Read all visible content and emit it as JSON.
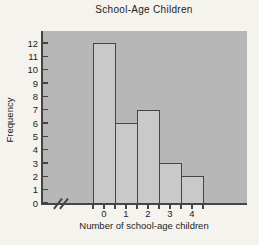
{
  "chart_data": {
    "type": "bar",
    "title": "School-Age Children",
    "xlabel": "Number of school-age children",
    "ylabel": "Frequency",
    "categories": [
      "0",
      "1",
      "2",
      "3",
      "4"
    ],
    "values": [
      12,
      6,
      7,
      3,
      2
    ],
    "ylim": [
      0,
      12
    ],
    "yticks": [
      0,
      1,
      2,
      3,
      4,
      5,
      6,
      7,
      8,
      9,
      10,
      11,
      12
    ],
    "grid": false,
    "legend": false,
    "axis_break_x": true,
    "colors": {
      "page_bg": "#f5f3ee",
      "plot_bg": "#b7b7b7",
      "bar_fill": "#c9c9c9",
      "line": "#454545",
      "text": "#1c1c1c"
    }
  }
}
